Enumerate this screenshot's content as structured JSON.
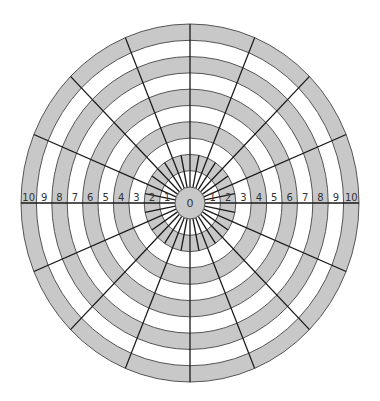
{
  "diagram": {
    "type": "polar-grid",
    "center": {
      "x": 190,
      "y": 203
    },
    "center_radius": {
      "rx": 15,
      "ry": 16
    },
    "ring_width": {
      "rx": 15.4,
      "ry": 16.3
    },
    "ring_count": 10,
    "colors": {
      "gray_fill": "#c8c8c8",
      "white_fill": "#ffffff",
      "ring_stroke": "#555555",
      "spoke_stroke": "#1a1a1a",
      "label_color": "#333333"
    },
    "center_label": "0",
    "long_spoke_count": 16,
    "short_spoke_count": 16,
    "short_spoke_outer_ring": 2,
    "left_axis_labels": [
      "10",
      "9",
      "8",
      "7",
      "6",
      "5",
      "4",
      "3",
      "2",
      "1"
    ],
    "right_axis_labels": [
      "1",
      "2",
      "3",
      "4",
      "5",
      "6",
      "7",
      "8",
      "9",
      "10"
    ],
    "ring_fill_pattern": [
      "gray",
      "white",
      "gray",
      "white",
      "gray",
      "white",
      "gray",
      "white",
      "gray",
      "white",
      "gray"
    ]
  }
}
